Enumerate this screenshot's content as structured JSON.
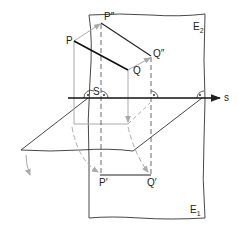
{
  "diagram": {
    "labels": {
      "P": "P",
      "Q": "Q",
      "P2": "P″",
      "Q2": "Q″",
      "P1": "P′",
      "Q1": "Q′",
      "S": "S",
      "s": "s",
      "E2_main": "E",
      "E2_sub": "2",
      "E1_main": "E",
      "E1_sub": "1"
    },
    "colors": {
      "line": "#222222",
      "construction": "#a8a8a8",
      "background": "#ffffff"
    }
  }
}
